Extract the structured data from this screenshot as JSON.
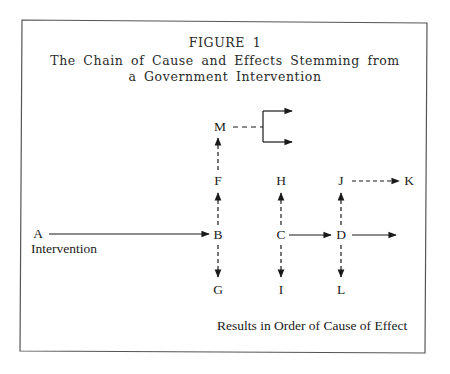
{
  "figure": {
    "number_label": "FIGURE 1",
    "title_line1": "The Chain of Cause and Effects Stemming from",
    "title_line2": "a Government Intervention",
    "caption": "Results in Order of Cause of Effect",
    "line_color": "#1a1a1a",
    "border_color": "#555555"
  },
  "nodes": {
    "A": "A",
    "A_sub": "Intervention",
    "B": "B",
    "C": "C",
    "D": "D",
    "F": "F",
    "G": "G",
    "H": "H",
    "I": "I",
    "J": "J",
    "K": "K",
    "L": "L",
    "M": "M"
  },
  "edges": [
    {
      "from": "A",
      "to": "B",
      "style": "solid"
    },
    {
      "from": "B",
      "to": "F",
      "style": "dashed"
    },
    {
      "from": "B",
      "to": "G",
      "style": "dashed"
    },
    {
      "from": "F",
      "to": "M",
      "style": "dashed"
    },
    {
      "from": "M",
      "to": "branch-upper",
      "style": "dashed-then-solid"
    },
    {
      "from": "M",
      "to": "branch-lower",
      "style": "dashed-then-solid"
    },
    {
      "from": "C",
      "to": "H",
      "style": "dashed"
    },
    {
      "from": "C",
      "to": "I",
      "style": "dashed"
    },
    {
      "from": "C",
      "to": "D",
      "style": "solid"
    },
    {
      "from": "D",
      "to": "J",
      "style": "dashed"
    },
    {
      "from": "D",
      "to": "L",
      "style": "dashed"
    },
    {
      "from": "D",
      "to": "onward",
      "style": "solid"
    },
    {
      "from": "J",
      "to": "K",
      "style": "dashed"
    }
  ]
}
